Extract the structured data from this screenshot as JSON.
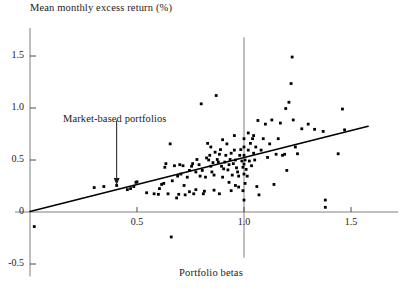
{
  "chart_data": {
    "type": "scatter",
    "title": "",
    "ylabel": "Mean monthly excess return (%)",
    "xlabel": "Portfolio betas",
    "xlim": [
      -0.07,
      1.72
    ],
    "ylim": [
      -0.62,
      1.77
    ],
    "grid": false,
    "legend": null,
    "xticks": [
      0.5,
      1.0,
      1.5
    ],
    "xtick_labels": [
      "0.5",
      "1.0",
      "1.5"
    ],
    "yticks": [
      -0.5,
      0,
      0.5,
      1.0,
      1.5
    ],
    "ytick_labels": [
      "-0.5",
      "0",
      "0.5",
      "1.0",
      "1.5"
    ],
    "annotations": [
      {
        "text": "Market-based portfolios",
        "label_x": 0.33,
        "label_y": 0.95,
        "arrow_from_x": 0.405,
        "arrow_from_y": 0.88,
        "arrow_to_x": 0.405,
        "arrow_to_y": 0.27
      }
    ],
    "reference_lines": [
      {
        "name": "market-beta-reference",
        "orientation": "vertical",
        "x": 1.0,
        "y_from": -0.44,
        "y_to": 1.68,
        "color": "#808080"
      }
    ],
    "fit_line": {
      "name": "security-market-line",
      "x_from": 0.0,
      "y_from": 0.005,
      "x_to": 1.58,
      "y_to": 0.825,
      "color": "#000000",
      "slope": 0.52,
      "intercept": 0.005
    },
    "series": [
      {
        "name": "portfolios",
        "marker": "square",
        "color": "#000000",
        "points": [
          [
            0.02,
            -0.14
          ],
          [
            0.3,
            0.235
          ],
          [
            0.345,
            0.245
          ],
          [
            0.405,
            0.255
          ],
          [
            0.455,
            0.215
          ],
          [
            0.47,
            0.225
          ],
          [
            0.485,
            0.245
          ],
          [
            0.495,
            0.285
          ],
          [
            0.5,
            0.29
          ],
          [
            0.545,
            0.185
          ],
          [
            0.6,
            0.17
          ],
          [
            0.615,
            0.265
          ],
          [
            0.625,
            0.275
          ],
          [
            0.63,
            0.43
          ],
          [
            0.635,
            0.465
          ],
          [
            0.645,
            0.175
          ],
          [
            0.655,
            0.655
          ],
          [
            0.66,
            -0.24
          ],
          [
            0.665,
            0.3
          ],
          [
            0.675,
            0.445
          ],
          [
            0.685,
            0.135
          ],
          [
            0.69,
            0.345
          ],
          [
            0.695,
            0.17
          ],
          [
            0.7,
            0.455
          ],
          [
            0.715,
            0.445
          ],
          [
            0.72,
            0.255
          ],
          [
            0.725,
            0.165
          ],
          [
            0.735,
            0.335
          ],
          [
            0.745,
            0.4
          ],
          [
            0.755,
            0.44
          ],
          [
            0.76,
            0.465
          ],
          [
            0.765,
            0.175
          ],
          [
            0.775,
            0.385
          ],
          [
            0.78,
            0.505
          ],
          [
            0.79,
            0.455
          ],
          [
            0.795,
            0.345
          ],
          [
            0.8,
            1.04
          ],
          [
            0.805,
            0.4
          ],
          [
            0.81,
            0.175
          ],
          [
            0.815,
            0.2
          ],
          [
            0.82,
            0.335
          ],
          [
            0.825,
            0.52
          ],
          [
            0.83,
            0.66
          ],
          [
            0.835,
            0.5
          ],
          [
            0.84,
            0.545
          ],
          [
            0.845,
            0.44
          ],
          [
            0.85,
            0.385
          ],
          [
            0.855,
            0.475
          ],
          [
            0.86,
            0.355
          ],
          [
            0.865,
            0.575
          ],
          [
            0.87,
            1.12
          ],
          [
            0.875,
            0.505
          ],
          [
            0.88,
            0.48
          ],
          [
            0.885,
            0.555
          ],
          [
            0.89,
            0.6
          ],
          [
            0.895,
            0.44
          ],
          [
            0.9,
            0.335
          ],
          [
            0.905,
            0.415
          ],
          [
            0.91,
            0.48
          ],
          [
            0.915,
            0.545
          ],
          [
            0.92,
            0.655
          ],
          [
            0.925,
            0.405
          ],
          [
            0.93,
            0.455
          ],
          [
            0.935,
            0.505
          ],
          [
            0.94,
            0.565
          ],
          [
            0.945,
            0.355
          ],
          [
            0.95,
            0.465
          ],
          [
            0.955,
            0.595
          ],
          [
            0.96,
            0.5
          ],
          [
            0.965,
            0.425
          ],
          [
            0.97,
            0.385
          ],
          [
            0.975,
            0.345
          ],
          [
            0.98,
            0.545
          ],
          [
            0.985,
            0.6
          ],
          [
            0.99,
            0.49
          ],
          [
            0.995,
            0.43
          ],
          [
            0.995,
            0.205
          ],
          [
            1.0,
            0.115
          ],
          [
            1.0,
            0.365
          ],
          [
            1.0,
            0.46
          ],
          [
            1.0,
            0.545
          ],
          [
            1.0,
            0.625
          ],
          [
            1.0,
            0.705
          ],
          [
            1.005,
            0.5
          ],
          [
            1.01,
            0.41
          ],
          [
            1.015,
            0.345
          ],
          [
            1.02,
            0.595
          ],
          [
            1.025,
            0.49
          ],
          [
            1.03,
            0.66
          ],
          [
            1.035,
            0.445
          ],
          [
            1.04,
            0.705
          ],
          [
            1.045,
            0.565
          ],
          [
            1.05,
            0.5
          ],
          [
            1.055,
            0.625
          ],
          [
            1.06,
            0.245
          ],
          [
            1.065,
            0.88
          ],
          [
            1.07,
            0.165
          ],
          [
            1.08,
            0.595
          ],
          [
            1.09,
            0.705
          ],
          [
            1.1,
            0.845
          ],
          [
            1.11,
            0.525
          ],
          [
            1.12,
            0.655
          ],
          [
            1.13,
            0.885
          ],
          [
            1.14,
            0.265
          ],
          [
            1.15,
            0.555
          ],
          [
            1.16,
            0.705
          ],
          [
            1.17,
            0.855
          ],
          [
            1.18,
            0.545
          ],
          [
            1.19,
            0.555
          ],
          [
            1.195,
            0.995
          ],
          [
            1.2,
            0.4
          ],
          [
            1.21,
            1.055
          ],
          [
            1.22,
            1.235
          ],
          [
            1.225,
            1.49
          ],
          [
            1.23,
            0.885
          ],
          [
            1.24,
            0.625
          ],
          [
            1.25,
            0.56
          ],
          [
            1.27,
            0.8
          ],
          [
            1.3,
            0.845
          ],
          [
            1.33,
            0.795
          ],
          [
            1.37,
            0.775
          ],
          [
            1.38,
            0.115
          ],
          [
            1.38,
            0.045
          ],
          [
            1.44,
            0.56
          ],
          [
            1.46,
            0.99
          ],
          [
            1.47,
            0.79
          ],
          [
            0.58,
            0.175
          ],
          [
            0.605,
            0.225
          ],
          [
            0.86,
            0.21
          ],
          [
            0.885,
            0.175
          ],
          [
            0.94,
            0.205
          ],
          [
            0.705,
            0.365
          ],
          [
            0.745,
            0.195
          ],
          [
            0.775,
            0.215
          ],
          [
            0.93,
            0.285
          ],
          [
            0.96,
            0.255
          ],
          [
            0.975,
            0.24
          ],
          [
            1.005,
            0.275
          ],
          [
            0.845,
            0.625
          ],
          [
            0.9,
            0.695
          ],
          [
            0.955,
            0.735
          ],
          [
            1.02,
            0.76
          ],
          [
            1.045,
            0.735
          ]
        ]
      }
    ]
  }
}
